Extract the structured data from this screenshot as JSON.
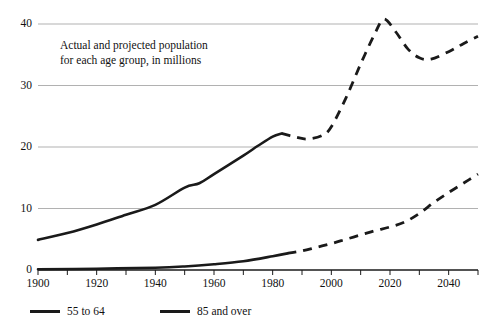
{
  "chart_data": {
    "type": "line",
    "title": "",
    "annotation": "Actual and projected population\nfor each age group, in millions",
    "xlabel": "",
    "ylabel": "",
    "xlim": [
      1900,
      2050
    ],
    "ylim": [
      0,
      40
    ],
    "grid": true,
    "gridlines_y": [
      0,
      10,
      20,
      30,
      40
    ],
    "yticks": [
      0,
      10,
      20,
      30,
      40
    ],
    "ytick_labels": [
      "0",
      "10",
      "20",
      "30",
      "40"
    ],
    "xticks": [
      1900,
      1920,
      1940,
      1960,
      1980,
      2000,
      2020,
      2040
    ],
    "xtick_labels": [
      "1900",
      "1920",
      "1940",
      "1960",
      "1980",
      "2000",
      "2020",
      "2040"
    ],
    "xminor_ticks": [
      1910,
      1930,
      1950,
      1970,
      1990,
      2010,
      2030,
      2050
    ],
    "legend_position": "below-left",
    "line_color": "#1a1a1a",
    "grid_color": "#a8a8a8",
    "axis_color": "#1a1a1a",
    "series": [
      {
        "name": "55 to 64",
        "actual": [
          {
            "x": 1900,
            "y": 4.9
          },
          {
            "x": 1910,
            "y": 6.0
          },
          {
            "x": 1920,
            "y": 7.4
          },
          {
            "x": 1930,
            "y": 9.0
          },
          {
            "x": 1940,
            "y": 10.6
          },
          {
            "x": 1950,
            "y": 13.4
          },
          {
            "x": 1955,
            "y": 14.1
          },
          {
            "x": 1960,
            "y": 15.6
          },
          {
            "x": 1970,
            "y": 18.6
          },
          {
            "x": 1975,
            "y": 20.2
          },
          {
            "x": 1980,
            "y": 21.7
          },
          {
            "x": 1983,
            "y": 22.2
          }
        ],
        "projected": [
          {
            "x": 1983,
            "y": 22.2
          },
          {
            "x": 1988,
            "y": 21.6
          },
          {
            "x": 1992,
            "y": 21.3
          },
          {
            "x": 1997,
            "y": 21.9
          },
          {
            "x": 2000,
            "y": 23.3
          },
          {
            "x": 2005,
            "y": 28.0
          },
          {
            "x": 2010,
            "y": 33.5
          },
          {
            "x": 2015,
            "y": 38.6
          },
          {
            "x": 2018,
            "y": 40.8
          },
          {
            "x": 2022,
            "y": 38.7
          },
          {
            "x": 2026,
            "y": 36.0
          },
          {
            "x": 2030,
            "y": 34.5
          },
          {
            "x": 2034,
            "y": 34.3
          },
          {
            "x": 2040,
            "y": 35.5
          },
          {
            "x": 2045,
            "y": 36.8
          },
          {
            "x": 2050,
            "y": 38.0
          }
        ]
      },
      {
        "name": "85 and over",
        "actual": [
          {
            "x": 1900,
            "y": 0.12
          },
          {
            "x": 1920,
            "y": 0.21
          },
          {
            "x": 1940,
            "y": 0.37
          },
          {
            "x": 1950,
            "y": 0.58
          },
          {
            "x": 1960,
            "y": 0.94
          },
          {
            "x": 1970,
            "y": 1.43
          },
          {
            "x": 1980,
            "y": 2.24
          },
          {
            "x": 1985,
            "y": 2.7
          }
        ],
        "projected": [
          {
            "x": 1985,
            "y": 2.7
          },
          {
            "x": 1990,
            "y": 3.1
          },
          {
            "x": 1995,
            "y": 3.7
          },
          {
            "x": 2000,
            "y": 4.3
          },
          {
            "x": 2005,
            "y": 5.0
          },
          {
            "x": 2010,
            "y": 5.7
          },
          {
            "x": 2015,
            "y": 6.4
          },
          {
            "x": 2020,
            "y": 7.0
          },
          {
            "x": 2025,
            "y": 7.8
          },
          {
            "x": 2030,
            "y": 9.2
          },
          {
            "x": 2035,
            "y": 11.0
          },
          {
            "x": 2040,
            "y": 12.6
          },
          {
            "x": 2045,
            "y": 14.1
          },
          {
            "x": 2050,
            "y": 15.6
          }
        ]
      }
    ]
  },
  "legend": {
    "items": [
      {
        "label": "55 to 64"
      },
      {
        "label": "85 and over"
      }
    ]
  }
}
